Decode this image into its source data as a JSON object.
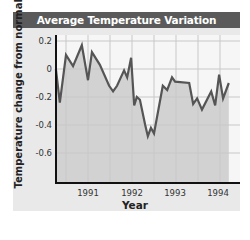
{
  "chart_data": {
    "type": "area",
    "title": "Average Temperature Variation",
    "xlabel": "Year",
    "ylabel": "Temperature change from normal (°C)",
    "xticks": [
      "1991",
      "1992",
      "1993",
      "1994"
    ],
    "yticks": [
      "0.2",
      "0",
      "-0.2",
      "-0.4",
      "-0.6"
    ],
    "ylim": [
      -0.8,
      0.2
    ],
    "xlim": [
      1990.25,
      1994.25
    ],
    "grid": true,
    "legend": null,
    "series": [
      {
        "name": "Temperature change from normal",
        "x": [
          1990.27,
          1990.36,
          1990.5,
          1990.66,
          1990.86,
          1991.0,
          1991.09,
          1991.27,
          1991.48,
          1991.57,
          1991.66,
          1991.82,
          1991.89,
          1991.98,
          1992.05,
          1992.11,
          1992.18,
          1992.3,
          1992.36,
          1992.43,
          1992.5,
          1992.7,
          1992.8,
          1992.91,
          1992.98,
          1993.3,
          1993.39,
          1993.48,
          1993.59,
          1993.8,
          1993.89,
          1993.98,
          1994.07,
          1994.2
        ],
        "values": [
          0.0,
          -0.24,
          0.1,
          0.02,
          0.17,
          -0.08,
          0.12,
          0.03,
          -0.12,
          -0.16,
          -0.12,
          -0.01,
          -0.06,
          0.08,
          -0.26,
          -0.2,
          -0.22,
          -0.4,
          -0.48,
          -0.42,
          -0.46,
          -0.12,
          -0.15,
          -0.06,
          -0.09,
          -0.1,
          -0.25,
          -0.21,
          -0.29,
          -0.16,
          -0.26,
          -0.04,
          -0.21,
          -0.1
        ]
      }
    ]
  },
  "colors": {
    "title_bg": "#5a5a5a",
    "card_bg": "#e9e9e9",
    "plot_bg": "#f6f6f6",
    "area_fill": "#d2d2d2",
    "line": "#555555",
    "grid": "#c8c8c8",
    "axis": "#111111"
  }
}
